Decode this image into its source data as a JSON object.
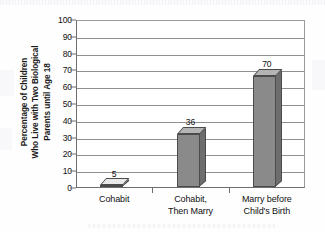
{
  "chart_data": {
    "type": "bar",
    "title": "",
    "subtitle": "",
    "xlabel": "",
    "ylabel": "Percentage of Children Who Live with Two Biological Parents until Age 18",
    "ylabel_lines": [
      "Percentage of Children",
      "Who Live with Two Biological",
      "Parents until Age 18"
    ],
    "categories": [
      "Cohabit",
      "Cohabit, Then Marry",
      "Marry before Child's Birth"
    ],
    "category_lines": [
      [
        "Cohabit"
      ],
      [
        "Cohabit,",
        "Then Marry"
      ],
      [
        "Marry before",
        "Child's Birth"
      ]
    ],
    "values": [
      5,
      36,
      70
    ],
    "value_labels": [
      "5",
      "36",
      "70"
    ],
    "ylim": [
      0,
      100
    ],
    "ytick_step": 10,
    "yticks": [
      0,
      10,
      20,
      30,
      40,
      50,
      60,
      70,
      80,
      90,
      100
    ],
    "ytick_labels": [
      "0",
      "10",
      "20",
      "30",
      "40",
      "50",
      "60",
      "70",
      "80",
      "90",
      "100"
    ],
    "grid": true,
    "legend": "none",
    "style": "3d-column",
    "bar_colors": [
      "#d4d4d4",
      "#8a8a8a",
      "#8a8a8a"
    ],
    "bar_top_colors": [
      "#eaeaea",
      "#b4b4b4",
      "#b4b4b4"
    ],
    "bar_side_colors": [
      "#bdbdbd",
      "#6d6d6d",
      "#6d6d6d"
    ],
    "axis_color": "#6e6e6e",
    "grid_color": "#8f8f8f",
    "text_color": "#111111"
  }
}
